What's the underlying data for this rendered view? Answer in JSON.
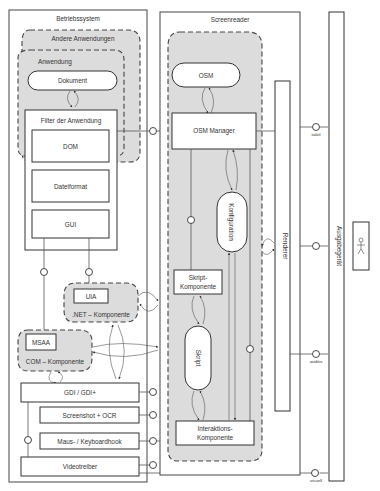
{
  "diagram": {
    "type": "architecture-diagram",
    "operating_system": {
      "title": "Betriebssystem",
      "other_apps": {
        "title": "Andere Anwendungen"
      },
      "application": {
        "title": "Anwendung",
        "document": "Dokument",
        "filter": {
          "title": "Filter der Anwendung",
          "layers": [
            "DOM",
            "Dateiformat",
            "GUI"
          ]
        }
      },
      "net_component": {
        "title": ".NET – Komponente",
        "inner": "UIA"
      },
      "com_component": {
        "title": "COM – Komponente",
        "inner": "MSAA"
      },
      "gdi": "GDI / GDI+",
      "screenshot": "Screenshot + OCR",
      "hook": "Maus- / Keyboardhook",
      "video": "Videotreiber"
    },
    "screenreader": {
      "title": "Screenreader",
      "osm": "OSM",
      "osm_manager": "OSM Manager",
      "configuration": "Konfiguration",
      "script_component": {
        "line1": "Skript-",
        "line2": "Komponente"
      },
      "script": "Skript",
      "interaction_component": {
        "line1": "Interaktions-",
        "line2": "Komponente"
      },
      "renderer": "Renderer"
    },
    "output_device": {
      "title": "Ausgabegerät",
      "channels": [
        "taktil",
        "auditiv",
        "visuell"
      ]
    },
    "user": {
      "icon": "stick-figure-icon"
    }
  }
}
